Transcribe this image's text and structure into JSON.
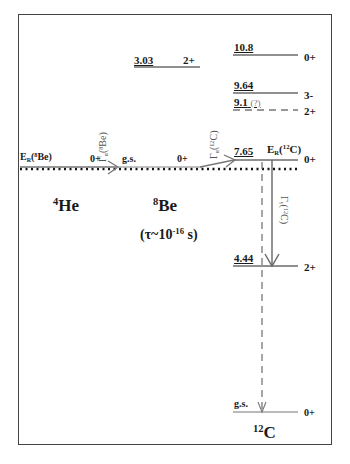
{
  "diagram": {
    "nuclei": {
      "he4": {
        "mass": "4",
        "symbol": "He"
      },
      "be8": {
        "mass": "8",
        "symbol": "Be",
        "lifetime": "(τ~10",
        "lifetime_exp": "-16",
        "lifetime_unit": " s)"
      },
      "c12": {
        "mass": "12",
        "symbol": "C"
      }
    },
    "be8_levels": [
      {
        "energy": "3.03",
        "spin": "2+"
      },
      {
        "energy": "g.s.",
        "spin": "0+"
      }
    ],
    "he4_level": {
      "spin": "0+"
    },
    "c12_levels": [
      {
        "energy": "10.8",
        "spin": "0+",
        "style": "solid"
      },
      {
        "energy": "9.64",
        "spin": "3-",
        "style": "solid"
      },
      {
        "energy": "9.1",
        "note": "(?)",
        "spin": "2+",
        "style": "dashed"
      },
      {
        "energy": "7.65",
        "spin": "0+",
        "style": "solid"
      },
      {
        "energy": "4.44",
        "spin": "2+",
        "style": "solid"
      },
      {
        "energy": "g.s.",
        "spin": "0+",
        "style": "solid"
      }
    ],
    "labels": {
      "er_be8": {
        "prefix": "E",
        "sub": "R",
        "open": "(",
        "sup": "8",
        "rest": "Be)"
      },
      "er_c12": {
        "prefix": "E",
        "sub": "R",
        "open": "(",
        "sup": "12",
        "rest": "C)"
      },
      "gamma_alpha_be8": {
        "prefix": "Γ",
        "sub": "α",
        "open": "(",
        "sup": "8",
        "rest": "Be)"
      },
      "gamma_alpha_c12": {
        "prefix": "Γ",
        "sub": "α",
        "open": "(",
        "sup": "12",
        "rest": "C)"
      },
      "gamma_gamma_c12": {
        "prefix": "Γ",
        "sub": "γ",
        "open": "(",
        "sup": "12",
        "rest": "C)"
      }
    },
    "colors": {
      "line": "#1a1a1a",
      "arrow": "#777777",
      "frame": "#444444",
      "dashed": "#555555"
    }
  }
}
